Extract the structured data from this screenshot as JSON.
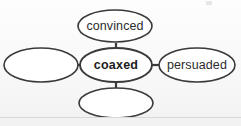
{
  "diagram": {
    "type": "word-web",
    "title": "",
    "background_color": "#fbfbfb",
    "stroke_color": "#3a3a3a",
    "fill_color": "#ffffff",
    "text_color": "#2c2c2c",
    "center": {
      "id": "center",
      "label": "coaxed",
      "bold": true,
      "cx": 116,
      "cy": 65,
      "rx": 36,
      "ry": 17
    },
    "nodes": [
      {
        "id": "top",
        "label": "convinced",
        "bold": false,
        "empty": false,
        "cx": 115,
        "cy": 26,
        "rx": 37,
        "ry": 16
      },
      {
        "id": "left",
        "label": "",
        "bold": false,
        "empty": true,
        "cx": 41,
        "cy": 65,
        "rx": 37,
        "ry": 17
      },
      {
        "id": "right",
        "label": "persuaded",
        "bold": false,
        "empty": false,
        "cx": 197,
        "cy": 65,
        "rx": 38,
        "ry": 17
      },
      {
        "id": "bottom",
        "label": "",
        "bold": false,
        "empty": true,
        "cx": 116,
        "cy": 103,
        "rx": 37,
        "ry": 15
      }
    ],
    "connectors": [
      {
        "id": "center-to-top",
        "x1": 116,
        "y1": 48,
        "x2": 116,
        "y2": 42,
        "orientation": "vertical"
      },
      {
        "id": "center-to-left",
        "x1": 80,
        "y1": 65,
        "x2": 78,
        "y2": 65,
        "orientation": "horizontal"
      },
      {
        "id": "center-to-right",
        "x1": 152,
        "y1": 65,
        "x2": 159,
        "y2": 65,
        "orientation": "horizontal"
      },
      {
        "id": "center-to-bottom",
        "x1": 116,
        "y1": 82,
        "x2": 116,
        "y2": 88,
        "orientation": "vertical"
      }
    ],
    "page_rule": {
      "visible": true
    }
  }
}
